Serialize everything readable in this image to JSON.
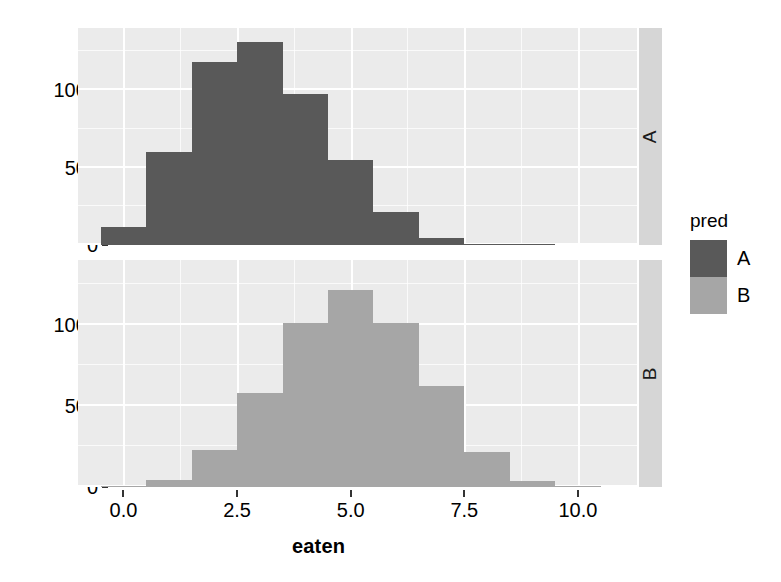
{
  "chart_data": {
    "type": "bar",
    "chart_kind": "faceted-histogram",
    "title": "",
    "subtitle": "",
    "xlabel": "eaten",
    "ylabel": "",
    "xlim": [
      -1.0,
      11.3
    ],
    "ylim": [
      0,
      1400
    ],
    "grid": true,
    "legend_position": "right",
    "legend_title": "pred",
    "bin_width": 1.0,
    "facet_variable": "pred",
    "facet_strips": [
      "A",
      "B"
    ],
    "x_ticks": [
      {
        "value": 0.0,
        "label": "0.0"
      },
      {
        "value": 2.5,
        "label": "2.5"
      },
      {
        "value": 5.0,
        "label": "5.0"
      },
      {
        "value": 7.5,
        "label": "7.5"
      },
      {
        "value": 10.0,
        "label": "10.0"
      }
    ],
    "y_ticks": [
      {
        "value": 0,
        "label": "0"
      },
      {
        "value": 500,
        "label": "500"
      },
      {
        "value": 1000,
        "label": "1000"
      }
    ],
    "x_minor_ticks": [
      1.25,
      3.75,
      6.25,
      8.75
    ],
    "y_minor_ticks": [
      250,
      750,
      1250
    ],
    "bin_centers": [
      0,
      1,
      2,
      3,
      4,
      5,
      6,
      7,
      8,
      9,
      10,
      11
    ],
    "panels": [
      {
        "strip_label": "A",
        "color": "#595959",
        "bins": [
          {
            "x0": -0.5,
            "x1": 0.5,
            "count": 115
          },
          {
            "x0": 0.5,
            "x1": 1.5,
            "count": 600
          },
          {
            "x0": 1.5,
            "x1": 2.5,
            "count": 1180
          },
          {
            "x0": 2.5,
            "x1": 3.5,
            "count": 1310
          },
          {
            "x0": 3.5,
            "x1": 4.5,
            "count": 975
          },
          {
            "x0": 4.5,
            "x1": 5.5,
            "count": 550
          },
          {
            "x0": 5.5,
            "x1": 6.5,
            "count": 210
          },
          {
            "x0": 6.5,
            "x1": 7.5,
            "count": 45
          },
          {
            "x0": 7.5,
            "x1": 8.5,
            "count": 8
          },
          {
            "x0": 8.5,
            "x1": 9.5,
            "count": 2
          },
          {
            "x0": 9.5,
            "x1": 10.5,
            "count": 0
          }
        ]
      },
      {
        "strip_label": "B",
        "color": "#a6a6a6",
        "bins": [
          {
            "x0": -0.5,
            "x1": 0.5,
            "count": 5
          },
          {
            "x0": 0.5,
            "x1": 1.5,
            "count": 45
          },
          {
            "x0": 1.5,
            "x1": 2.5,
            "count": 230
          },
          {
            "x0": 2.5,
            "x1": 3.5,
            "count": 580
          },
          {
            "x0": 3.5,
            "x1": 4.5,
            "count": 1010
          },
          {
            "x0": 4.5,
            "x1": 5.5,
            "count": 1215
          },
          {
            "x0": 5.5,
            "x1": 6.5,
            "count": 1010
          },
          {
            "x0": 6.5,
            "x1": 7.5,
            "count": 620
          },
          {
            "x0": 7.5,
            "x1": 8.5,
            "count": 215
          },
          {
            "x0": 8.5,
            "x1": 9.5,
            "count": 40
          },
          {
            "x0": 9.5,
            "x1": 10.5,
            "count": 5
          }
        ]
      }
    ],
    "legend_entries": [
      {
        "label": "A",
        "color": "#595959"
      },
      {
        "label": "B",
        "color": "#a6a6a6"
      }
    ]
  },
  "style": {
    "panel_bg": "#ebebeb",
    "grid_color": "#ffffff",
    "strip_bg": "#d6d6d6",
    "text_color": "#000000",
    "page_bg": "#ffffff"
  }
}
